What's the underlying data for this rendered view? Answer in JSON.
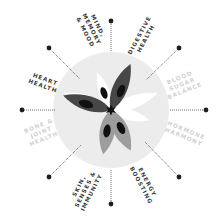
{
  "diagram": {
    "center": {
      "x": 111,
      "y": 110
    },
    "disk": {
      "radius": 58,
      "color": "#ececec"
    },
    "colors": {
      "active_label": "#3a3a3a",
      "inactive_label": "#cfcfcf",
      "spoke_dot": "#1e1e1e",
      "petal_dark": "#474747",
      "petal_medium": "#9d9d9d",
      "petal_light": "#ffffff",
      "petal_spot": "#111111"
    },
    "categories": [
      {
        "id": "mind",
        "lines": [
          "MIND,",
          "MEMORY",
          "& MOOD"
        ],
        "active": true
      },
      {
        "id": "digestive",
        "lines": [
          "DIGESTIVE",
          "HEALTH"
        ],
        "active": true
      },
      {
        "id": "blood-sugar",
        "lines": [
          "BLOOD",
          "SUGAR",
          "BALANCE"
        ],
        "active": false
      },
      {
        "id": "hormone",
        "lines": [
          "HORMONE",
          "HARMONY"
        ],
        "active": false
      },
      {
        "id": "energy",
        "lines": [
          "ENERGY",
          "BOOSTING"
        ],
        "active": true
      },
      {
        "id": "skin",
        "lines": [
          "SKIN,",
          "SENSES &",
          "IMMUNITY"
        ],
        "active": true
      },
      {
        "id": "bone",
        "lines": [
          "BONE &",
          "JOINT",
          "HEALTH"
        ],
        "active": false
      },
      {
        "id": "heart",
        "lines": [
          "HEART",
          "HEALTH"
        ],
        "active": true
      }
    ]
  }
}
